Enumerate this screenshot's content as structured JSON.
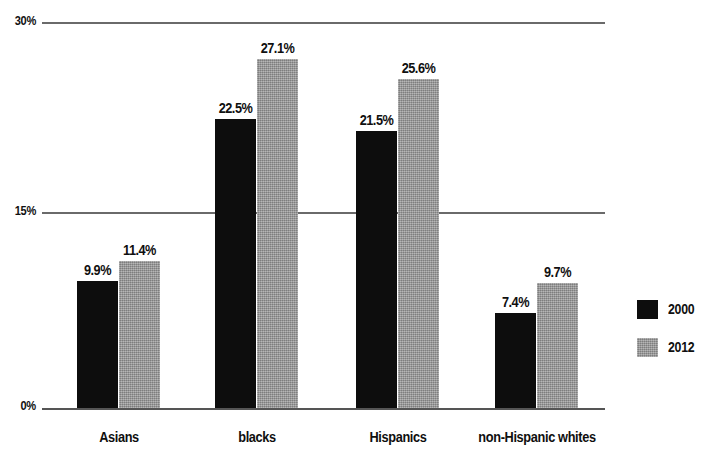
{
  "chart_data": {
    "type": "bar",
    "title": "",
    "subtitle": "",
    "xlabel": "",
    "ylabel": "",
    "categories": [
      "Asians",
      "blacks",
      "Hispanics",
      "non-Hispanic whites"
    ],
    "series": [
      {
        "name": "2000",
        "color": "#0d0d0d",
        "values": [
          9.9,
          22.5,
          21.5,
          7.4
        ],
        "labels": [
          "9.9%",
          "22.5%",
          "21.5%",
          "7.4%"
        ]
      },
      {
        "name": "2012",
        "color": "#9a9a9a",
        "values": [
          11.4,
          27.1,
          25.6,
          9.7
        ],
        "labels": [
          "11.4%",
          "27.1%",
          "25.6%",
          "9.7%"
        ]
      }
    ],
    "ylim": [
      0,
      30
    ],
    "yticks": [
      0,
      15,
      30
    ],
    "ytick_labels": [
      "0%",
      "15%",
      "30%"
    ],
    "grid": true,
    "legend_position": "right",
    "value_labels_shown": true
  },
  "axis": {
    "ticks": [
      {
        "label": "30%",
        "value": 30
      },
      {
        "label": "15%",
        "value": 15
      },
      {
        "label": "0%",
        "value": 0
      }
    ]
  },
  "legend": {
    "entries": [
      {
        "label": "2000",
        "swatch": "legend-swatch-2000"
      },
      {
        "label": "2012",
        "swatch": "legend-swatch-2012"
      }
    ]
  },
  "groups": [
    {
      "category": "Asians",
      "bars": [
        {
          "series": "2000",
          "value": 9.9,
          "label": "9.9%"
        },
        {
          "series": "2012",
          "value": 11.4,
          "label": "11.4%"
        }
      ]
    },
    {
      "category": "blacks",
      "bars": [
        {
          "series": "2000",
          "value": 22.5,
          "label": "22.5%"
        },
        {
          "series": "2012",
          "value": 27.1,
          "label": "27.1%"
        }
      ]
    },
    {
      "category": "Hispanics",
      "bars": [
        {
          "series": "2000",
          "value": 21.5,
          "label": "21.5%"
        },
        {
          "series": "2012",
          "value": 25.6,
          "label": "25.6%"
        }
      ]
    },
    {
      "category": "non-Hispanic whites",
      "bars": [
        {
          "series": "2000",
          "value": 7.4,
          "label": "7.4%"
        },
        {
          "series": "2012",
          "value": 9.7,
          "label": "9.7%"
        }
      ]
    }
  ]
}
